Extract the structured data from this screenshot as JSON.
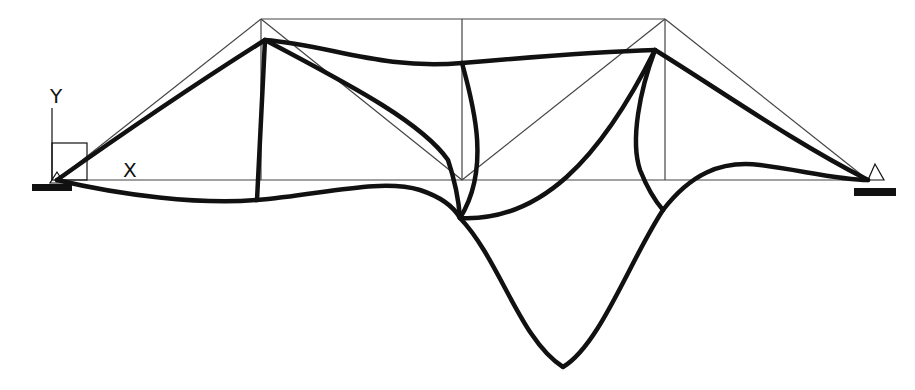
{
  "diagram": {
    "title": "",
    "axis_labels": {
      "x": "X",
      "y": "Y"
    },
    "colors": {
      "undeformed": "#444444",
      "deformed": "#111111",
      "support": "#111111",
      "background": "#ffffff"
    },
    "supports": [
      {
        "name": "left-pin-support",
        "x": 57,
        "y": 180
      },
      {
        "name": "right-pin-support",
        "x": 868,
        "y": 180
      }
    ],
    "undeformed_nodes": {
      "bottom": [
        [
          57,
          180
        ],
        [
          261,
          180
        ],
        [
          462,
          180
        ],
        [
          665,
          180
        ],
        [
          868,
          180
        ]
      ],
      "top": [
        [
          261,
          19
        ],
        [
          462,
          19
        ],
        [
          665,
          19
        ]
      ]
    },
    "deformed_nodes": {
      "left_support": [
        57,
        180
      ],
      "top_left": [
        265,
        40
      ],
      "top_mid": [
        462,
        63
      ],
      "top_right": [
        655,
        50
      ],
      "bottom_left": [
        257,
        200
      ],
      "bottom_mid": [
        460,
        218
      ],
      "bottom_right": [
        663,
        210
      ],
      "right_support": [
        868,
        180
      ]
    }
  }
}
